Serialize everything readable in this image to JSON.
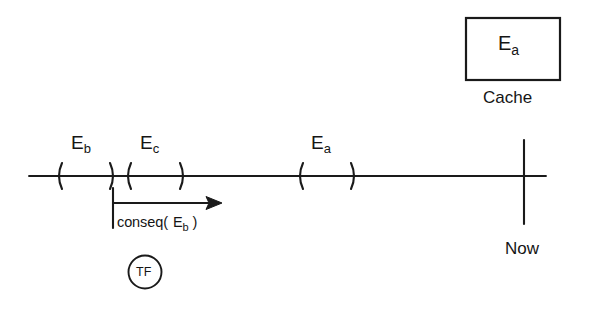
{
  "figure": {
    "type": "timeline-diagram",
    "background_color": "#ffffff",
    "stroke_color": "#1a1a1a"
  },
  "cache": {
    "box_label_main": "E",
    "box_label_sub": "a",
    "caption": "Cache"
  },
  "timeline": {
    "now_marker_label": "Now",
    "intervals": [
      {
        "name": "E_b",
        "label_main": "E",
        "label_sub": "b",
        "open_paren": "(",
        "close_paren": ")"
      },
      {
        "name": "E_c",
        "label_main": "E",
        "label_sub": "c",
        "open_paren": "(",
        "close_paren": ")"
      },
      {
        "name": "E_a",
        "label_main": "E",
        "label_sub": "a",
        "open_paren": "(",
        "close_paren": ")"
      }
    ]
  },
  "conseq_arrow": {
    "label_prefix": "conseq(",
    "label_main": "E",
    "label_sub": "b",
    "label_suffix": ")"
  },
  "tf_node": {
    "label": "TF"
  }
}
